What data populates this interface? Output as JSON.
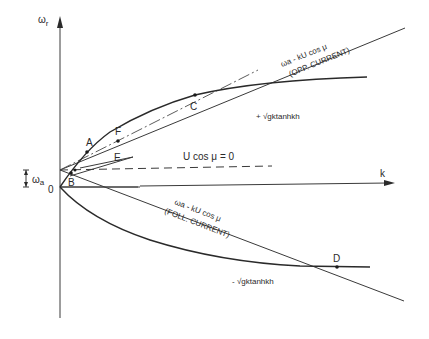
{
  "diagram": {
    "axes": {
      "y_label": "ω",
      "y_label_sub": "r",
      "x_label": "k",
      "origin_label": "0",
      "offset_label": "ω",
      "offset_label_sub": "a"
    },
    "points": {
      "A": "A",
      "B": "B",
      "C": "C",
      "D": "D",
      "E": "E",
      "F": "F"
    },
    "curves": {
      "opp_formula": "ωa - kU cos μ",
      "opp_note": "(OPP. CURRENT)",
      "foll_formula": "ωa - kU cos μ",
      "foll_note": "(FOLL. CURRENT)",
      "zero_current": "U cos μ = 0",
      "plus_branch": "+ √gktanhkh",
      "minus_branch": "- √gktanhkh"
    }
  }
}
